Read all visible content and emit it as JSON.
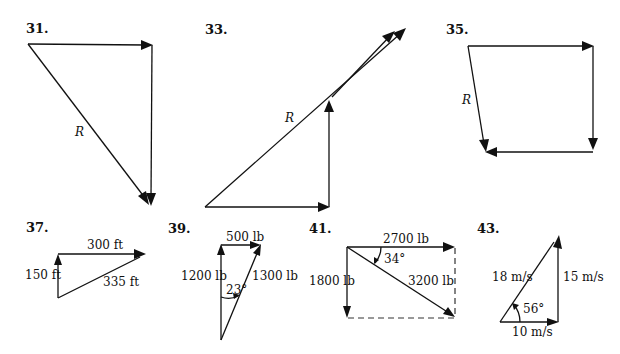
{
  "figures": [
    {
      "id": "31",
      "number": "31.",
      "labels": {
        "resultant": "R"
      }
    },
    {
      "id": "33",
      "number": "33.",
      "labels": {
        "resultant": "R"
      }
    },
    {
      "id": "35",
      "number": "35.",
      "labels": {
        "resultant": "R"
      }
    },
    {
      "id": "37",
      "number": "37.",
      "labels": {
        "top": "300 ft",
        "left": "150 ft",
        "hyp": "335 ft"
      }
    },
    {
      "id": "39",
      "number": "39.",
      "labels": {
        "top": "500 lb",
        "left": "1200 lb",
        "right": "1300 lb",
        "angle": "23°"
      }
    },
    {
      "id": "41",
      "number": "41.",
      "labels": {
        "top": "2700 lb",
        "left": "1800 lb",
        "diag": "3200 lb",
        "angle": "34°"
      }
    },
    {
      "id": "43",
      "number": "43.",
      "labels": {
        "hyp": "18 m/s",
        "right": "15 m/s",
        "bottom": "10 m/s",
        "angle": "56°"
      }
    }
  ]
}
